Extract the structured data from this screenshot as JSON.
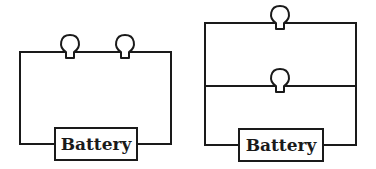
{
  "diagram": {
    "type": "circuit-comparison",
    "circuits": [
      {
        "name": "series-circuit",
        "battery_label": "Battery",
        "bulb_count": 2,
        "arrangement": "series"
      },
      {
        "name": "parallel-circuit",
        "battery_label": "Battery",
        "bulb_count": 2,
        "arrangement": "parallel"
      }
    ],
    "colors": {
      "line": "#1a1a1a",
      "background": "#ffffff"
    }
  }
}
